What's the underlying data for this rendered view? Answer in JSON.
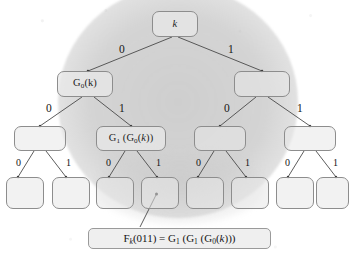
{
  "figure": {
    "type": "binary-tree",
    "levels": 4,
    "colors": {
      "node_border": "#8d8d8d",
      "node_fill": "#e8e8e8",
      "edge": "#4a4a4a",
      "shading": "#c4c4c4",
      "text": "#1d1d1d",
      "background": "#ffffff"
    }
  },
  "nodes": {
    "root": {
      "label": "k",
      "italic": true
    },
    "level1": [
      {
        "label": "",
        "path": "0"
      },
      {
        "label": "",
        "path": "1"
      }
    ],
    "level2": [
      {
        "label": "",
        "path": "00"
      },
      {
        "label": "G1(G0(k))",
        "path": "01"
      },
      {
        "label": "",
        "path": "10"
      },
      {
        "label": "",
        "path": "11"
      }
    ],
    "level3": [
      {
        "label": "",
        "path": "000"
      },
      {
        "label": "",
        "path": "001"
      },
      {
        "label": "",
        "path": "010"
      },
      {
        "label": "",
        "path": "011",
        "highlighted": true
      },
      {
        "label": "",
        "path": "100"
      },
      {
        "label": "",
        "path": "101"
      },
      {
        "label": "",
        "path": "110"
      },
      {
        "label": "",
        "path": "111"
      }
    ]
  },
  "node_labels": {
    "root_k": "k",
    "g0k": "G",
    "g0k_sub": "0",
    "g0k_arg": "(k)",
    "g1g0k_main": "G",
    "g1g0k_sub": "1",
    "g1g0k_rest": "(G",
    "g1g0k_sub2": "0",
    "g1g0k_tail": "(k))"
  },
  "edge_labels": {
    "level1": [
      "0",
      "1"
    ],
    "level2": [
      "0",
      "1",
      "0",
      "1"
    ],
    "level3": [
      "0",
      "1",
      "0",
      "1",
      "0",
      "1",
      "0",
      "1"
    ]
  },
  "caption": {
    "full_text": "Fk(011) = G1 (G1 (G0(k)))",
    "f": "F",
    "f_sub": "k",
    "arg": "(011) = G",
    "g1_sub_a": "1",
    "mid": " (G",
    "g1_sub_b": "1",
    "mid2": " (G",
    "g0_sub": "0",
    "tail": "(k)))",
    "points_to_path": "011"
  }
}
